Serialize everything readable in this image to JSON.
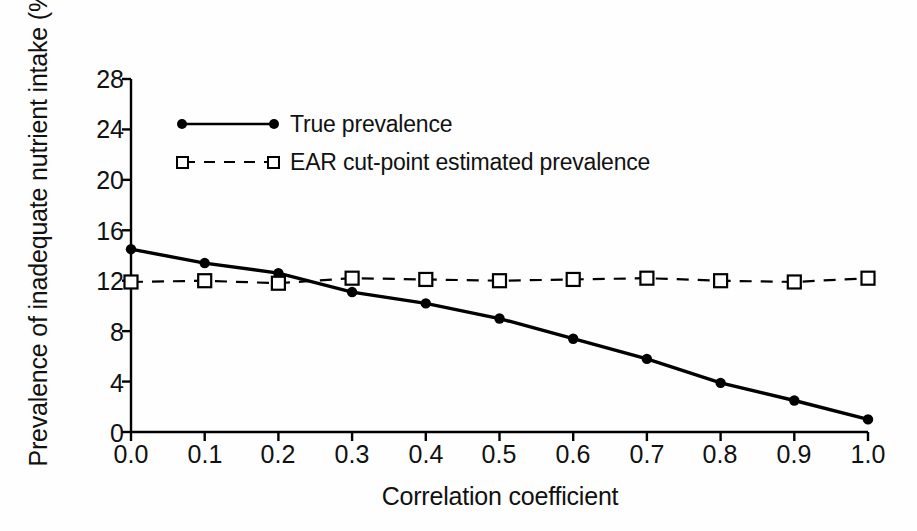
{
  "chart_data": {
    "type": "line",
    "title": "",
    "xlabel": "Correlation coefficient",
    "ylabel": "Prevalence of inadequate nutrient intake (%)",
    "x": [
      0.0,
      0.1,
      0.2,
      0.3,
      0.4,
      0.5,
      0.6,
      0.7,
      0.8,
      0.9,
      1.0
    ],
    "xtick_labels": [
      "0.0",
      "0.1",
      "0.2",
      "0.3",
      "0.4",
      "0.5",
      "0.6",
      "0.7",
      "0.8",
      "0.9",
      "1.0"
    ],
    "ytick_labels": [
      "0",
      "4",
      "8",
      "12",
      "16",
      "20",
      "24",
      "28"
    ],
    "ytick_values": [
      0,
      4,
      8,
      12,
      16,
      20,
      24,
      28
    ],
    "xlim": [
      0.0,
      1.0
    ],
    "ylim": [
      0,
      28
    ],
    "grid": false,
    "legend_position": "upper-left-inside",
    "series": [
      {
        "name": "True prevalence",
        "marker": "filled-circle",
        "line_style": "solid",
        "color": "#000000",
        "values": [
          14.5,
          13.4,
          12.6,
          11.1,
          10.2,
          9.0,
          7.4,
          5.8,
          3.9,
          2.5,
          1.0
        ]
      },
      {
        "name": "EAR cut-point estimated prevalence",
        "marker": "open-square",
        "line_style": "dashed",
        "color": "#000000",
        "values": [
          11.9,
          12.0,
          11.8,
          12.2,
          12.1,
          12.0,
          12.1,
          12.2,
          12.0,
          11.9,
          12.2
        ]
      }
    ]
  },
  "figure": {
    "background_color": "#fefefe",
    "axis_color": "#000000"
  }
}
